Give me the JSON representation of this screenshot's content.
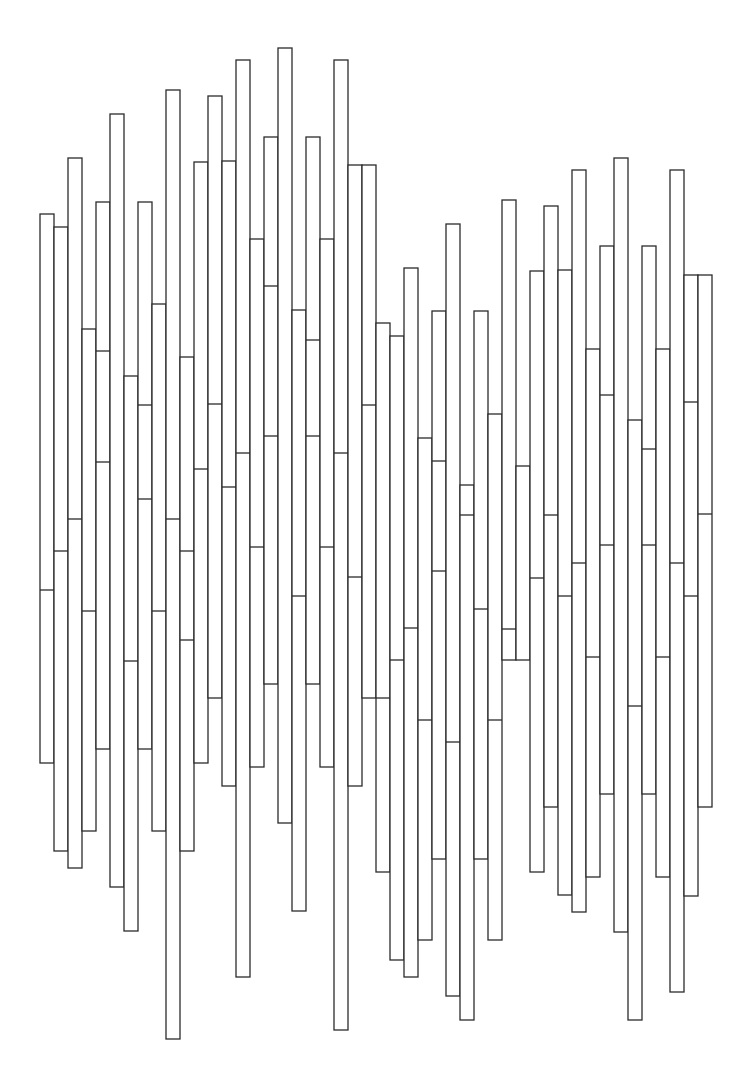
{
  "artwork": {
    "description": "Abstract line drawing of adjacent narrow vertical rectangles with internal horizontal dividers",
    "stroke_color": "#2b2b2b",
    "background_color": "#ffffff",
    "column_width": 14,
    "columns": [
      {
        "x": 40,
        "top": 214,
        "bottom": 763,
        "dividers": [
          590
        ]
      },
      {
        "x": 54,
        "top": 227,
        "bottom": 851,
        "dividers": [
          551
        ]
      },
      {
        "x": 68,
        "top": 158,
        "bottom": 868,
        "dividers": [
          519
        ]
      },
      {
        "x": 82,
        "top": 329,
        "bottom": 831,
        "dividers": [
          611
        ]
      },
      {
        "x": 96,
        "top": 202,
        "bottom": 749,
        "dividers": [
          351,
          462
        ]
      },
      {
        "x": 110,
        "top": 114,
        "bottom": 887,
        "dividers": []
      },
      {
        "x": 124,
        "top": 376,
        "bottom": 931,
        "dividers": [
          661
        ]
      },
      {
        "x": 138,
        "top": 202,
        "bottom": 749,
        "dividers": [
          405,
          499
        ]
      },
      {
        "x": 152,
        "top": 304,
        "bottom": 831,
        "dividers": [
          611
        ]
      },
      {
        "x": 166,
        "top": 90,
        "bottom": 1039,
        "dividers": [
          519
        ]
      },
      {
        "x": 180,
        "top": 357,
        "bottom": 851,
        "dividers": [
          551,
          640
        ]
      },
      {
        "x": 194,
        "top": 162,
        "bottom": 763,
        "dividers": [
          469
        ]
      },
      {
        "x": 208,
        "top": 96,
        "bottom": 698,
        "dividers": [
          404
        ]
      },
      {
        "x": 222,
        "top": 161,
        "bottom": 786,
        "dividers": [
          487
        ]
      },
      {
        "x": 236,
        "top": 60,
        "bottom": 977,
        "dividers": [
          453
        ]
      },
      {
        "x": 250,
        "top": 239,
        "bottom": 767,
        "dividers": [
          547
        ]
      },
      {
        "x": 264,
        "top": 137,
        "bottom": 684,
        "dividers": [
          286,
          436
        ]
      },
      {
        "x": 278,
        "top": 48,
        "bottom": 823,
        "dividers": []
      },
      {
        "x": 292,
        "top": 310,
        "bottom": 911,
        "dividers": [
          596
        ]
      },
      {
        "x": 306,
        "top": 137,
        "bottom": 684,
        "dividers": [
          340,
          436
        ]
      },
      {
        "x": 320,
        "top": 239,
        "bottom": 767,
        "dividers": [
          547
        ]
      },
      {
        "x": 334,
        "top": 60,
        "bottom": 1030,
        "dividers": [
          453
        ]
      },
      {
        "x": 348,
        "top": 165,
        "bottom": 786,
        "dividers": [
          577
        ]
      },
      {
        "x": 362,
        "top": 165,
        "bottom": 698,
        "dividers": [
          405
        ]
      },
      {
        "x": 376,
        "top": 323,
        "bottom": 872,
        "dividers": [
          698
        ]
      },
      {
        "x": 390,
        "top": 336,
        "bottom": 960,
        "dividers": [
          660
        ]
      },
      {
        "x": 404,
        "top": 268,
        "bottom": 977,
        "dividers": [
          628
        ]
      },
      {
        "x": 418,
        "top": 438,
        "bottom": 940,
        "dividers": [
          720
        ]
      },
      {
        "x": 432,
        "top": 311,
        "bottom": 859,
        "dividers": [
          461,
          571
        ]
      },
      {
        "x": 446,
        "top": 224,
        "bottom": 996,
        "dividers": [
          742
        ]
      },
      {
        "x": 460,
        "top": 485,
        "bottom": 1020,
        "dividers": [
          515
        ]
      },
      {
        "x": 474,
        "top": 311,
        "bottom": 859,
        "dividers": [
          609
        ]
      },
      {
        "x": 488,
        "top": 414,
        "bottom": 940,
        "dividers": [
          720
        ]
      },
      {
        "x": 502,
        "top": 200,
        "bottom": 660,
        "dividers": [
          629
        ]
      },
      {
        "x": 516,
        "top": 466,
        "bottom": 660,
        "dividers": []
      },
      {
        "x": 530,
        "top": 271,
        "bottom": 872,
        "dividers": [
          578
        ]
      },
      {
        "x": 544,
        "top": 206,
        "bottom": 807,
        "dividers": [
          515
        ]
      },
      {
        "x": 558,
        "top": 270,
        "bottom": 895,
        "dividers": [
          596
        ]
      },
      {
        "x": 572,
        "top": 170,
        "bottom": 912,
        "dividers": [
          563
        ]
      },
      {
        "x": 586,
        "top": 349,
        "bottom": 877,
        "dividers": [
          657
        ]
      },
      {
        "x": 600,
        "top": 246,
        "bottom": 794,
        "dividers": [
          395,
          545
        ]
      },
      {
        "x": 614,
        "top": 158,
        "bottom": 932,
        "dividers": []
      },
      {
        "x": 628,
        "top": 420,
        "bottom": 1020,
        "dividers": [
          706
        ]
      },
      {
        "x": 642,
        "top": 246,
        "bottom": 794,
        "dividers": [
          449,
          545
        ]
      },
      {
        "x": 656,
        "top": 349,
        "bottom": 877,
        "dividers": [
          657
        ]
      },
      {
        "x": 670,
        "top": 170,
        "bottom": 992,
        "dividers": [
          563
        ]
      },
      {
        "x": 684,
        "top": 275,
        "bottom": 896,
        "dividers": [
          402,
          596
        ]
      },
      {
        "x": 698,
        "top": 275,
        "bottom": 807,
        "dividers": [
          514
        ]
      }
    ]
  }
}
